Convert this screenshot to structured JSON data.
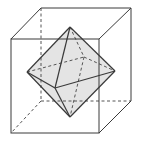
{
  "diagram": {
    "colors": {
      "stroke": "#3a3a3a",
      "hidden": "#555555",
      "face_fill": "#e4e4e4",
      "background": "#ffffff"
    },
    "cube": {
      "front": [
        [
          11,
          39
        ],
        [
          99,
          39
        ],
        [
          99,
          133
        ],
        [
          11,
          133
        ]
      ],
      "back": [
        [
          41,
          8
        ],
        [
          131,
          8
        ],
        [
          131,
          101
        ],
        [
          41,
          101
        ]
      ]
    },
    "octahedron": {
      "top": [
        70,
        27
      ],
      "bottom": [
        70,
        117
      ],
      "left": [
        27,
        72
      ],
      "right": [
        115,
        71
      ],
      "front": [
        55,
        88
      ],
      "back": [
        84,
        57
      ]
    }
  }
}
